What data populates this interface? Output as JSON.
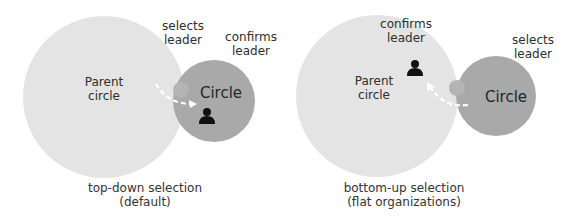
{
  "diagrams": [
    {
      "id": "top-down",
      "parent_circle_label": [
        "Parent",
        "circle"
      ],
      "circle_label": "Circle",
      "annotation_left": [
        "selects",
        "leader"
      ],
      "annotation_right": [
        "confirms",
        "leader"
      ],
      "caption": [
        "top-down selection",
        "(default)"
      ],
      "leader_icon": "person-icon",
      "arrow_direction": "parent-to-circle"
    },
    {
      "id": "bottom-up",
      "parent_circle_label": [
        "Parent",
        "circle"
      ],
      "circle_label": "Circle",
      "annotation_left": [
        "confirms",
        "leader"
      ],
      "annotation_right": [
        "selects",
        "leader"
      ],
      "caption": [
        "bottom-up selection",
        "(flat organizations)"
      ],
      "leader_icon": "person-icon",
      "arrow_direction": "circle-to-parent"
    }
  ],
  "colors": {
    "parent_circle": "#e4e4e4",
    "circle": "#a9a9a9",
    "arrow": "#ffffff",
    "icon": "#111111",
    "text": "#2e2e2e"
  }
}
